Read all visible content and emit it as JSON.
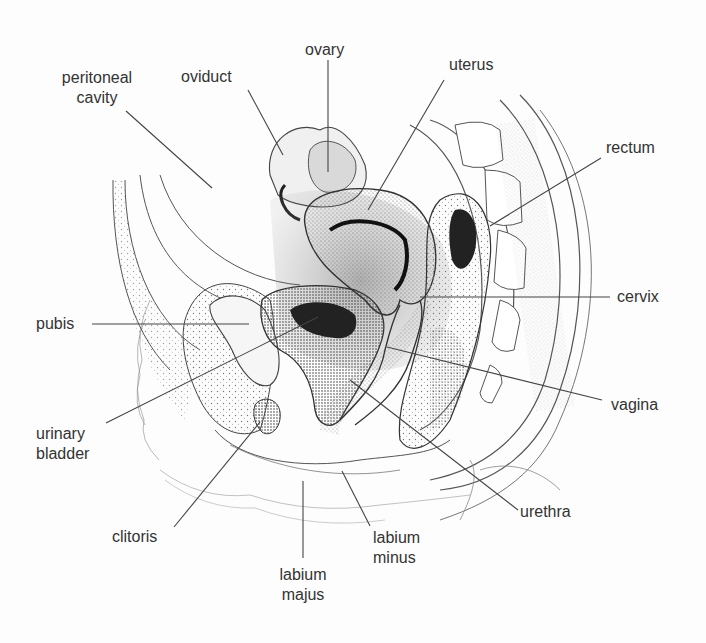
{
  "diagram": {
    "colors": {
      "ink": "#333333",
      "line": "#444444",
      "background": "#fdfdfd"
    },
    "labels": [
      {
        "id": "ovary",
        "text": "ovary"
      },
      {
        "id": "peritoneal-cavity",
        "line1": "peritoneal",
        "line2": "cavity"
      },
      {
        "id": "oviduct",
        "text": "oviduct"
      },
      {
        "id": "uterus",
        "text": "uterus"
      },
      {
        "id": "rectum",
        "text": "rectum"
      },
      {
        "id": "pubis",
        "text": "pubis"
      },
      {
        "id": "cervix",
        "text": "cervix"
      },
      {
        "id": "vagina",
        "text": "vagina"
      },
      {
        "id": "urinary-bladder",
        "line1": "urinary",
        "line2": "bladder"
      },
      {
        "id": "urethra",
        "text": "urethra"
      },
      {
        "id": "clitoris",
        "text": "clitoris"
      },
      {
        "id": "labium-minus",
        "line1": "labium",
        "line2": "minus"
      },
      {
        "id": "labium-majus",
        "line1": "labium",
        "line2": "majus"
      }
    ]
  }
}
